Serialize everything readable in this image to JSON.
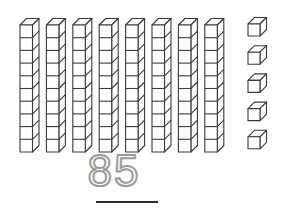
{
  "diagram": {
    "tens": {
      "count": 8,
      "cubes_per_rod": 10
    },
    "ones": {
      "count": 5
    },
    "number": "85",
    "colors": {
      "stroke": "#3a3a3a",
      "number_dashed": "#9a9a9a",
      "underline": "#2a2a2a",
      "background": "#ffffff"
    }
  }
}
